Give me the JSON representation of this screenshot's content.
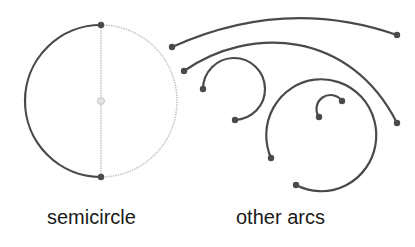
{
  "colors": {
    "arc": "#4a4a4a",
    "guide": "#c4c4c4",
    "background": "#ffffff",
    "text": "#1a1a1a"
  },
  "captions": {
    "semicircle": "semicircle",
    "other_arcs": "other arcs"
  },
  "semicircle": {
    "center": [
      101,
      101
    ],
    "radius": 76,
    "top": [
      101,
      25
    ],
    "bottom": [
      101,
      177
    ],
    "drawn_side": "left",
    "guide_side": "right"
  },
  "arcs": [
    {
      "name": "arc-1",
      "d": "M172 47 Q285 -4 397 35",
      "start": [
        172,
        47
      ],
      "end": [
        397,
        35
      ]
    },
    {
      "name": "arc-2",
      "d": "M184 71 C250 25 350 30 397 123",
      "start": [
        184,
        71
      ],
      "end": [
        397,
        123
      ]
    },
    {
      "name": "arc-3",
      "d": "M203 89 A31 31 0 1 1 235 120",
      "start": [
        203,
        89
      ],
      "end": [
        235,
        120
      ]
    },
    {
      "name": "arc-4",
      "d": "M271 158 A55 56 0 1 1 296 185",
      "start": [
        271,
        158
      ],
      "end": [
        296,
        185
      ]
    },
    {
      "name": "arc-5",
      "d": "M319 117 A12 12 0 0 1 342 101",
      "start": [
        319,
        117
      ],
      "end": [
        342,
        101
      ]
    }
  ]
}
